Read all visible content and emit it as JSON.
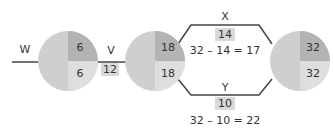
{
  "colors": {
    "circle_base": "#cfcfcf",
    "quadrant_top_right": "#b3b3b3",
    "quadrant_bottom_right": "#dedede",
    "edge": "#444444",
    "label_box": "#d9d9d9",
    "text": "#333333"
  },
  "edges": {
    "w": {
      "label": "W"
    },
    "v": {
      "label": "V",
      "value": "12"
    },
    "x": {
      "label": "X",
      "value": "14",
      "equation": "32 – 14 = 17"
    },
    "y": {
      "label": "Y",
      "value": "10",
      "equation": "32 – 10 = 22"
    }
  },
  "nodes": [
    {
      "top": "6",
      "bottom": "6"
    },
    {
      "top": "18",
      "bottom": "18"
    },
    {
      "top": "32",
      "bottom": "32"
    }
  ]
}
